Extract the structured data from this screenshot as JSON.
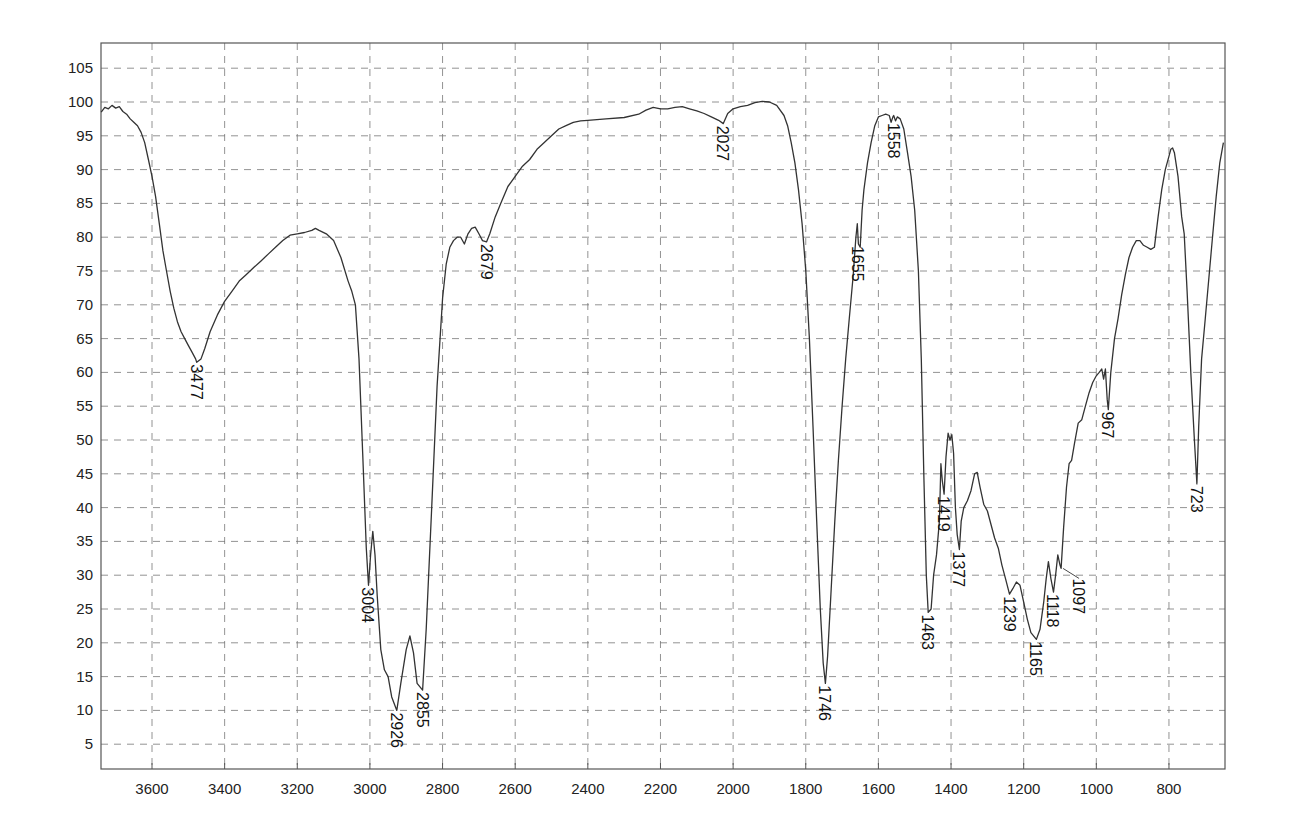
{
  "chart_data": {
    "type": "line",
    "title": "",
    "xlabel": "",
    "ylabel": "",
    "x_reversed": true,
    "xlim": [
      3740,
      648
    ],
    "ylim": [
      1.3,
      109
    ],
    "grid": true,
    "legend": null,
    "x_ticks": [
      3600,
      3400,
      3200,
      3000,
      2800,
      2600,
      2400,
      2200,
      2000,
      1800,
      1600,
      1400,
      1200,
      1000,
      800
    ],
    "y_ticks": [
      5,
      10,
      15,
      20,
      25,
      30,
      35,
      40,
      45,
      50,
      55,
      60,
      65,
      70,
      75,
      80,
      85,
      90,
      95,
      100,
      105
    ],
    "series": [
      {
        "name": "IR spectrum",
        "color": "#333333",
        "points": [
          [
            3740,
            98.5
          ],
          [
            3730,
            99.2
          ],
          [
            3720,
            99.0
          ],
          [
            3710,
            99.5
          ],
          [
            3700,
            99.1
          ],
          [
            3690,
            99.3
          ],
          [
            3680,
            98.6
          ],
          [
            3670,
            98.2
          ],
          [
            3660,
            97.5
          ],
          [
            3650,
            97.0
          ],
          [
            3640,
            96.5
          ],
          [
            3630,
            95.5
          ],
          [
            3620,
            94.0
          ],
          [
            3610,
            91.5
          ],
          [
            3600,
            89.0
          ],
          [
            3590,
            86.0
          ],
          [
            3580,
            82.0
          ],
          [
            3570,
            78.0
          ],
          [
            3560,
            75.0
          ],
          [
            3550,
            72.0
          ],
          [
            3540,
            69.5
          ],
          [
            3530,
            67.5
          ],
          [
            3520,
            66.0
          ],
          [
            3510,
            65.0
          ],
          [
            3500,
            64.0
          ],
          [
            3490,
            63.0
          ],
          [
            3480,
            62.0
          ],
          [
            3477,
            61.5
          ],
          [
            3465,
            62.0
          ],
          [
            3455,
            63.5
          ],
          [
            3440,
            66.0
          ],
          [
            3420,
            68.5
          ],
          [
            3400,
            70.5
          ],
          [
            3380,
            72.0
          ],
          [
            3360,
            73.5
          ],
          [
            3340,
            74.5
          ],
          [
            3320,
            75.5
          ],
          [
            3300,
            76.5
          ],
          [
            3280,
            77.5
          ],
          [
            3260,
            78.5
          ],
          [
            3240,
            79.5
          ],
          [
            3220,
            80.3
          ],
          [
            3200,
            80.5
          ],
          [
            3180,
            80.7
          ],
          [
            3160,
            81.0
          ],
          [
            3150,
            81.3
          ],
          [
            3140,
            81.0
          ],
          [
            3120,
            80.5
          ],
          [
            3100,
            79.5
          ],
          [
            3080,
            77.0
          ],
          [
            3060,
            73.5
          ],
          [
            3050,
            72.0
          ],
          [
            3040,
            70.0
          ],
          [
            3030,
            62.0
          ],
          [
            3020,
            48.0
          ],
          [
            3010,
            34.0
          ],
          [
            3004,
            28.5
          ],
          [
            2998,
            33.0
          ],
          [
            2992,
            36.5
          ],
          [
            2986,
            33.0
          ],
          [
            2980,
            27.0
          ],
          [
            2970,
            19.0
          ],
          [
            2960,
            16.0
          ],
          [
            2950,
            15.0
          ],
          [
            2940,
            12.0
          ],
          [
            2926,
            10.0
          ],
          [
            2915,
            14.0
          ],
          [
            2900,
            19.0
          ],
          [
            2890,
            21.0
          ],
          [
            2880,
            18.5
          ],
          [
            2870,
            14.0
          ],
          [
            2855,
            13.0
          ],
          [
            2845,
            22.0
          ],
          [
            2830,
            40.0
          ],
          [
            2815,
            58.0
          ],
          [
            2800,
            71.0
          ],
          [
            2790,
            76.0
          ],
          [
            2780,
            78.5
          ],
          [
            2770,
            79.5
          ],
          [
            2760,
            80.0
          ],
          [
            2750,
            80.0
          ],
          [
            2740,
            79.0
          ],
          [
            2730,
            80.5
          ],
          [
            2720,
            81.3
          ],
          [
            2710,
            81.5
          ],
          [
            2700,
            80.5
          ],
          [
            2690,
            79.5
          ],
          [
            2679,
            79.3
          ],
          [
            2670,
            80.5
          ],
          [
            2655,
            83.0
          ],
          [
            2640,
            85.0
          ],
          [
            2620,
            87.5
          ],
          [
            2600,
            89.0
          ],
          [
            2580,
            90.5
          ],
          [
            2560,
            91.5
          ],
          [
            2540,
            93.0
          ],
          [
            2520,
            94.0
          ],
          [
            2500,
            95.0
          ],
          [
            2480,
            96.0
          ],
          [
            2460,
            96.5
          ],
          [
            2440,
            97.0
          ],
          [
            2420,
            97.2
          ],
          [
            2400,
            97.3
          ],
          [
            2350,
            97.5
          ],
          [
            2300,
            97.7
          ],
          [
            2260,
            98.2
          ],
          [
            2240,
            98.8
          ],
          [
            2220,
            99.2
          ],
          [
            2200,
            99.0
          ],
          [
            2180,
            99.0
          ],
          [
            2160,
            99.2
          ],
          [
            2140,
            99.3
          ],
          [
            2120,
            99.0
          ],
          [
            2100,
            98.7
          ],
          [
            2080,
            98.3
          ],
          [
            2060,
            97.8
          ],
          [
            2040,
            97.3
          ],
          [
            2027,
            96.8
          ],
          [
            2015,
            98.3
          ],
          [
            2000,
            99.0
          ],
          [
            1980,
            99.3
          ],
          [
            1960,
            99.5
          ],
          [
            1940,
            99.9
          ],
          [
            1920,
            100.1
          ],
          [
            1900,
            100.0
          ],
          [
            1880,
            99.5
          ],
          [
            1860,
            98.0
          ],
          [
            1850,
            96.5
          ],
          [
            1840,
            94.0
          ],
          [
            1830,
            91.0
          ],
          [
            1820,
            87.0
          ],
          [
            1810,
            82.0
          ],
          [
            1800,
            75.0
          ],
          [
            1790,
            65.0
          ],
          [
            1780,
            52.0
          ],
          [
            1770,
            38.0
          ],
          [
            1760,
            25.0
          ],
          [
            1752,
            17.0
          ],
          [
            1746,
            14.0
          ],
          [
            1740,
            18.0
          ],
          [
            1730,
            28.0
          ],
          [
            1720,
            38.0
          ],
          [
            1710,
            47.0
          ],
          [
            1700,
            55.0
          ],
          [
            1690,
            62.0
          ],
          [
            1680,
            68.0
          ],
          [
            1670,
            74.0
          ],
          [
            1662,
            80.0
          ],
          [
            1658,
            82.0
          ],
          [
            1655,
            79.0
          ],
          [
            1650,
            78.5
          ],
          [
            1645,
            84.0
          ],
          [
            1640,
            87.0
          ],
          [
            1630,
            91.0
          ],
          [
            1620,
            94.0
          ],
          [
            1610,
            96.5
          ],
          [
            1600,
            97.8
          ],
          [
            1590,
            98.0
          ],
          [
            1580,
            98.2
          ],
          [
            1570,
            98.0
          ],
          [
            1565,
            97.0
          ],
          [
            1560,
            97.8
          ],
          [
            1558,
            98.0
          ],
          [
            1553,
            97.2
          ],
          [
            1548,
            97.8
          ],
          [
            1540,
            97.5
          ],
          [
            1530,
            96.0
          ],
          [
            1520,
            92.5
          ],
          [
            1510,
            89.0
          ],
          [
            1500,
            84.0
          ],
          [
            1490,
            75.0
          ],
          [
            1482,
            62.0
          ],
          [
            1475,
            45.0
          ],
          [
            1468,
            30.0
          ],
          [
            1463,
            24.5
          ],
          [
            1455,
            25.0
          ],
          [
            1448,
            30.0
          ],
          [
            1440,
            33.0
          ],
          [
            1432,
            38.0
          ],
          [
            1428,
            46.5
          ],
          [
            1424,
            44.0
          ],
          [
            1419,
            42.0
          ],
          [
            1414,
            47.5
          ],
          [
            1408,
            51.0
          ],
          [
            1403,
            50.0
          ],
          [
            1398,
            50.8
          ],
          [
            1393,
            48.0
          ],
          [
            1388,
            40.0
          ],
          [
            1383,
            36.0
          ],
          [
            1377,
            33.8
          ],
          [
            1372,
            38.0
          ],
          [
            1365,
            40.0
          ],
          [
            1355,
            41.0
          ],
          [
            1345,
            42.5
          ],
          [
            1335,
            45.0
          ],
          [
            1328,
            45.2
          ],
          [
            1320,
            43.0
          ],
          [
            1310,
            40.5
          ],
          [
            1300,
            39.5
          ],
          [
            1290,
            37.5
          ],
          [
            1280,
            35.5
          ],
          [
            1270,
            34.0
          ],
          [
            1260,
            31.5
          ],
          [
            1250,
            29.5
          ],
          [
            1239,
            27.2
          ],
          [
            1230,
            28.0
          ],
          [
            1220,
            29.0
          ],
          [
            1210,
            28.5
          ],
          [
            1200,
            26.0
          ],
          [
            1190,
            23.5
          ],
          [
            1180,
            21.5
          ],
          [
            1165,
            20.5
          ],
          [
            1155,
            22.0
          ],
          [
            1145,
            26.0
          ],
          [
            1138,
            29.5
          ],
          [
            1132,
            32.0
          ],
          [
            1125,
            29.5
          ],
          [
            1118,
            27.5
          ],
          [
            1112,
            30.0
          ],
          [
            1106,
            33.0
          ],
          [
            1100,
            31.5
          ],
          [
            1097,
            31.0
          ],
          [
            1090,
            37.0
          ],
          [
            1082,
            43.0
          ],
          [
            1075,
            46.5
          ],
          [
            1068,
            47.0
          ],
          [
            1060,
            49.5
          ],
          [
            1050,
            52.5
          ],
          [
            1040,
            53.0
          ],
          [
            1030,
            55.0
          ],
          [
            1020,
            57.0
          ],
          [
            1010,
            58.5
          ],
          [
            1000,
            59.5
          ],
          [
            992,
            60.0
          ],
          [
            985,
            60.5
          ],
          [
            980,
            59.0
          ],
          [
            975,
            60.5
          ],
          [
            970,
            56.0
          ],
          [
            967,
            54.5
          ],
          [
            960,
            60.0
          ],
          [
            950,
            65.0
          ],
          [
            940,
            68.0
          ],
          [
            930,
            71.5
          ],
          [
            920,
            74.5
          ],
          [
            910,
            77.0
          ],
          [
            900,
            78.5
          ],
          [
            890,
            79.5
          ],
          [
            880,
            79.5
          ],
          [
            870,
            78.8
          ],
          [
            860,
            78.5
          ],
          [
            850,
            78.2
          ],
          [
            840,
            78.5
          ],
          [
            830,
            83.0
          ],
          [
            820,
            87.0
          ],
          [
            810,
            90.0
          ],
          [
            800,
            92.0
          ],
          [
            795,
            93.0
          ],
          [
            790,
            93.2
          ],
          [
            785,
            92.5
          ],
          [
            775,
            89.0
          ],
          [
            765,
            83.0
          ],
          [
            758,
            80.5
          ],
          [
            750,
            72.0
          ],
          [
            740,
            60.0
          ],
          [
            730,
            50.0
          ],
          [
            723,
            43.5
          ],
          [
            718,
            52.0
          ],
          [
            710,
            62.0
          ],
          [
            700,
            68.0
          ],
          [
            690,
            74.0
          ],
          [
            680,
            80.0
          ],
          [
            670,
            86.0
          ],
          [
            660,
            91.0
          ],
          [
            650,
            94.0
          ]
        ]
      }
    ],
    "annotations": [
      {
        "label": "3477",
        "wn": 3477,
        "t": 61.5
      },
      {
        "label": "3004",
        "wn": 3004,
        "t": 28.5
      },
      {
        "label": "2926",
        "wn": 2926,
        "t": 10.0
      },
      {
        "label": "2855",
        "wn": 2855,
        "t": 13.0
      },
      {
        "label": "2679",
        "wn": 2679,
        "t": 79.3
      },
      {
        "label": "2027",
        "wn": 2027,
        "t": 96.8
      },
      {
        "label": "1746",
        "wn": 1746,
        "t": 14.0
      },
      {
        "label": "1655",
        "wn": 1655,
        "t": 79.0
      },
      {
        "label": "1558",
        "wn": 1558,
        "t": 97.2
      },
      {
        "label": "1463",
        "wn": 1463,
        "t": 24.5
      },
      {
        "label": "1419",
        "wn": 1419,
        "t": 42.0
      },
      {
        "label": "1377",
        "wn": 1377,
        "t": 33.8
      },
      {
        "label": "1239",
        "wn": 1239,
        "t": 27.2
      },
      {
        "label": "1165",
        "wn": 1165,
        "t": 20.5
      },
      {
        "label": "1118",
        "wn": 1118,
        "t": 27.5
      },
      {
        "label": "1097",
        "wn": 1097,
        "t": 31.0,
        "leader": true
      },
      {
        "label": "967",
        "wn": 967,
        "t": 54.5
      },
      {
        "label": "723",
        "wn": 723,
        "t": 43.5
      }
    ]
  },
  "style": {
    "line_color": "#333333",
    "grid_color": "#777777",
    "frame_color": "#555555",
    "text_color": "#222222"
  }
}
